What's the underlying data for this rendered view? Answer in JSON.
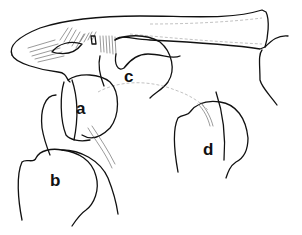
{
  "figure": {
    "type": "anatomical line drawing",
    "background": "#ffffff",
    "line_color": "#111111",
    "labels": [
      {
        "id": "a",
        "text": "a",
        "x": 76,
        "y": 99
      },
      {
        "id": "b",
        "text": "b",
        "x": 52,
        "y": 171
      },
      {
        "id": "c",
        "text": "c",
        "x": 125,
        "y": 67
      },
      {
        "id": "d",
        "text": "d",
        "x": 204,
        "y": 140
      }
    ]
  }
}
